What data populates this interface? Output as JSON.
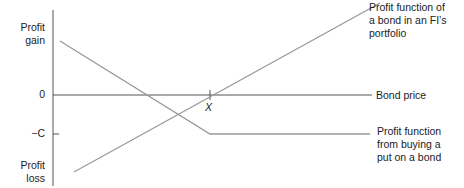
{
  "labels": {
    "profit_gain": [
      "Profit",
      "gain"
    ],
    "profit_loss": [
      "Profit",
      "loss"
    ],
    "zero": "0",
    "minus_c": "−C",
    "x": "X",
    "bond_price": "Bond price",
    "bond_profit": [
      "Profit function of",
      "a bond in an FI’s",
      "portfolio"
    ],
    "put_profit": [
      "Profit function",
      "from buying a",
      "put on a bond"
    ]
  },
  "colors": {
    "axis": "#555555",
    "curve": "#999999"
  }
}
